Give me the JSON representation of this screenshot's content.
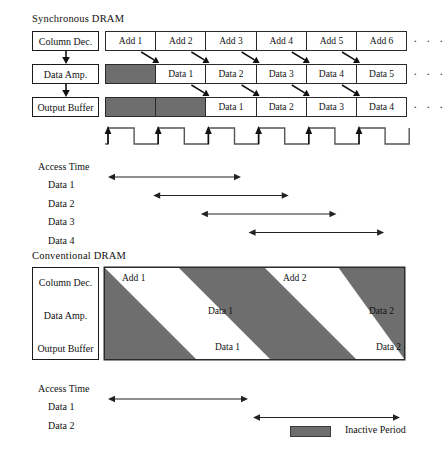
{
  "figure": {
    "gray_color": "#6e6e6e",
    "line_color": "#2a2a2a",
    "ellipsis": "· · ·"
  },
  "sync": {
    "title": "Synchronous DRAM",
    "stage_labels": [
      "Column Dec.",
      "Data Amp.",
      "Output Buffer"
    ],
    "rows": [
      {
        "name": "column-decoder-row",
        "cells": [
          {
            "text": "Add 1",
            "inactive": false
          },
          {
            "text": "Add 2",
            "inactive": false
          },
          {
            "text": "Add 3",
            "inactive": false
          },
          {
            "text": "Add 4",
            "inactive": false
          },
          {
            "text": "Add 5",
            "inactive": false
          },
          {
            "text": "Add 6",
            "inactive": false
          }
        ]
      },
      {
        "name": "data-amp-row",
        "cells": [
          {
            "text": "",
            "inactive": true
          },
          {
            "text": "Data 1",
            "inactive": false
          },
          {
            "text": "Data 2",
            "inactive": false
          },
          {
            "text": "Data 3",
            "inactive": false
          },
          {
            "text": "Data 4",
            "inactive": false
          },
          {
            "text": "Data 5",
            "inactive": false
          }
        ]
      },
      {
        "name": "output-buffer-row",
        "cells": [
          {
            "text": "",
            "inactive": true
          },
          {
            "text": "",
            "inactive": true
          },
          {
            "text": "Data 1",
            "inactive": false
          },
          {
            "text": "Data 2",
            "inactive": false
          },
          {
            "text": "Data 3",
            "inactive": false
          },
          {
            "text": "Data 4",
            "inactive": false
          }
        ]
      }
    ],
    "clock_cycles": 6,
    "access_time": {
      "title": "Access Time",
      "entries": [
        {
          "label": "Data 1",
          "start_cycle": 0,
          "end_cycle": 2.65
        },
        {
          "label": "Data 2",
          "start_cycle": 0.9,
          "end_cycle": 3.6
        },
        {
          "label": "Data 3",
          "start_cycle": 1.85,
          "end_cycle": 4.55
        },
        {
          "label": "Data 4",
          "start_cycle": 2.8,
          "end_cycle": 5.5
        }
      ]
    }
  },
  "conventional": {
    "title": "Conventional DRAM",
    "stage_labels": [
      "Column Dec.",
      "Data Amp.",
      "Output Buffer"
    ],
    "bands": [
      {
        "add_label": "Add 1",
        "amp_label": "Data 1",
        "out_label": "Data 1"
      },
      {
        "add_label": "Add 2",
        "amp_label": "Data 2",
        "out_label": "Data 2"
      }
    ],
    "access_time": {
      "title": "Access Time",
      "entries": [
        {
          "label": "Data 1",
          "start_px": 108,
          "end_px": 248
        },
        {
          "label": "Data 2",
          "start_px": 253,
          "end_px": 400
        }
      ]
    }
  },
  "legend": {
    "swatch_label": "Inactive Period",
    "swatch_color": "#6e6e6e"
  }
}
